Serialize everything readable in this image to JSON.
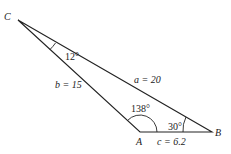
{
  "vertices": {
    "A": "A",
    "B": "B",
    "C": "C"
  },
  "sides": {
    "a": "a = 20",
    "b": "b = 15",
    "c": "c = 6.2"
  },
  "angles": {
    "A": "138°",
    "B": "30°",
    "C": "12°"
  },
  "colors": {
    "line": "#222222",
    "background": "#ffffff"
  }
}
